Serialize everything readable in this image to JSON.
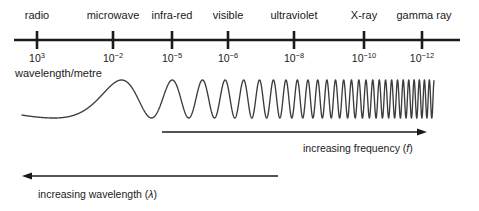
{
  "figure": {
    "axis_caption": "wavelength/metre",
    "bands": [
      {
        "name": "radio",
        "x": 37,
        "tick_mantissa": "10",
        "tick_exponent": "3",
        "tick_label": "10^3"
      },
      {
        "name": "microwave",
        "x": 113,
        "tick_mantissa": "10",
        "tick_exponent": "−2",
        "tick_label": "10^-2"
      },
      {
        "name": "infra-red",
        "x": 172,
        "tick_mantissa": "10",
        "tick_exponent": "−5",
        "tick_label": "10^-5"
      },
      {
        "name": "visible",
        "x": 228,
        "tick_mantissa": "10",
        "tick_exponent": "−6",
        "tick_label": "10^-6"
      },
      {
        "name": "ultraviolet",
        "x": 294,
        "tick_mantissa": "10",
        "tick_exponent": "−8",
        "tick_label": "10^-8"
      },
      {
        "name": "X-ray",
        "x": 364,
        "tick_mantissa": "10",
        "tick_exponent": "−10",
        "tick_label": "10^-10"
      },
      {
        "name": "gamma ray",
        "x": 424,
        "tick_mantissa": "10",
        "tick_exponent": "−12",
        "tick_label": "10^-12"
      }
    ],
    "frequency_arrow": {
      "caption_prefix": "increasing frequency (",
      "caption_symbol": "f",
      "caption_suffix": ")",
      "direction": "right"
    },
    "wavelength_arrow": {
      "caption_prefix": "increasing wavelength (",
      "caption_symbol": "λ",
      "caption_suffix": ")",
      "direction": "left"
    },
    "colors": {
      "ink": "#1a1a1a",
      "wave_stroke": "#3c3c3c",
      "background": "#ffffff"
    }
  },
  "chart_data": {
    "type": "line",
    "title": "",
    "xlabel": "wavelength/metre",
    "ylabel": "",
    "categories": [
      "radio",
      "microwave",
      "infra-red",
      "visible",
      "ultraviolet",
      "X-ray",
      "gamma ray"
    ],
    "tick_labels": [
      "10^3",
      "10^-2",
      "10^-5",
      "10^-6",
      "10^-8",
      "10^-10",
      "10^-12"
    ],
    "tick_exponents": [
      3,
      -2,
      -5,
      -6,
      -8,
      -10,
      -12
    ],
    "tick_pixel_x": [
      37,
      113,
      172,
      228,
      294,
      364,
      422
    ],
    "axis_pixel_range": [
      14,
      460
    ],
    "axis_pixel_y": 40,
    "grid": false,
    "legend": "none",
    "annotations": [
      {
        "text": "increasing frequency (f)",
        "direction": "right",
        "x_from": 162,
        "x_to": 425,
        "y": 132
      },
      {
        "text": "increasing wavelength (λ)",
        "direction": "left",
        "x_from": 278,
        "x_to": 22,
        "y": 176
      }
    ],
    "wave": {
      "description": "Sinusoid of monotonically increasing frequency (chirp) from left to right, constant amplitude",
      "x_start": 22,
      "x_end": 434,
      "baseline_y": 99,
      "amplitude": 19,
      "cycles_left_to_right": "approximately 1 cycle at left increasing to very dense oscillation at right"
    }
  }
}
